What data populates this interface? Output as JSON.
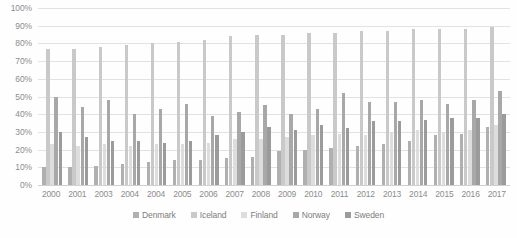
{
  "chart_data": {
    "type": "bar",
    "title": "",
    "subtitle": "",
    "xlabel": "",
    "ylabel": "",
    "ylim": [
      0,
      100
    ],
    "y_unit": "%",
    "grid": true,
    "legend_position": "bottom",
    "y_ticks": [
      "0%",
      "10%",
      "20%",
      "30%",
      "40%",
      "50%",
      "60%",
      "70%",
      "80%",
      "90%",
      "100%"
    ],
    "y_tick_values": [
      0,
      10,
      20,
      30,
      40,
      50,
      60,
      70,
      80,
      90,
      100
    ],
    "categories": [
      "2000",
      "2001",
      "2003",
      "2004",
      "2004",
      "2005",
      "2006",
      "2007",
      "2008",
      "2009",
      "2010",
      "2011",
      "2012",
      "2013",
      "2014",
      "2015",
      "2016",
      "2017"
    ],
    "series": [
      {
        "name": "Denmark",
        "color": "#b0b0b0",
        "values": [
          10,
          10,
          11,
          12,
          13,
          14,
          14,
          15,
          16,
          19,
          20,
          21,
          22,
          23,
          25,
          28,
          29,
          33
        ]
      },
      {
        "name": "Iceland",
        "color": "#c9c9c9",
        "values": [
          77,
          77,
          78,
          79,
          80,
          81,
          82,
          84,
          85,
          85,
          86,
          86,
          87,
          87,
          88,
          88,
          88,
          89
        ]
      },
      {
        "name": "Finland",
        "color": "#dddddd",
        "values": [
          23,
          22,
          23,
          22,
          23,
          23,
          24,
          26,
          26,
          27,
          28,
          29,
          28,
          30,
          31,
          30,
          31,
          34
        ]
      },
      {
        "name": "Norway",
        "color": "#a8a8a8",
        "values": [
          50,
          44,
          48,
          40,
          43,
          46,
          39,
          41,
          45,
          40,
          43,
          52,
          47,
          47,
          48,
          46,
          48,
          53
        ]
      },
      {
        "name": "Sweden",
        "color": "#9b9b9b",
        "values": [
          30,
          27,
          25,
          25,
          24,
          25,
          28,
          30,
          33,
          31,
          34,
          32,
          36,
          36,
          37,
          38,
          38,
          40
        ]
      }
    ]
  },
  "legend": {
    "items": [
      {
        "label": "Denmark"
      },
      {
        "label": "Iceland"
      },
      {
        "label": "Finland"
      },
      {
        "label": "Norway"
      },
      {
        "label": "Sweden"
      }
    ]
  }
}
